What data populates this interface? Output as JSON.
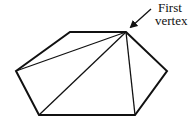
{
  "diagram": {
    "type": "polygon-triangulation",
    "shape": "hexagon",
    "colors": {
      "stroke": "#111111",
      "background": "#ffffff"
    },
    "vertices": [
      {
        "id": "v1",
        "x": 126,
        "y": 32
      },
      {
        "id": "v2",
        "x": 167,
        "y": 71
      },
      {
        "id": "v3",
        "x": 135,
        "y": 115
      },
      {
        "id": "v4",
        "x": 39,
        "y": 115
      },
      {
        "id": "v5",
        "x": 16,
        "y": 71
      },
      {
        "id": "v6",
        "x": 70,
        "y": 32
      }
    ],
    "diagonals_from_first_vertex": [
      {
        "to": "v3"
      },
      {
        "to": "v4"
      },
      {
        "to": "v5"
      }
    ],
    "annotation": {
      "line1": "First",
      "line2": "vertex",
      "points_to": "v1"
    }
  }
}
